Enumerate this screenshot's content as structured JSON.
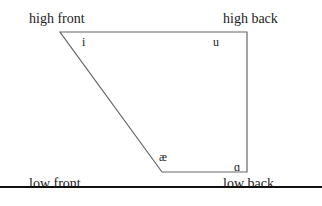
{
  "diagram": {
    "corners": {
      "high_front": "high front",
      "high_back": "high back",
      "low_front": "low front",
      "low_back": "low back"
    },
    "vowels": {
      "i": "i",
      "u": "u",
      "ae": "æ",
      "a": "ɑ"
    },
    "line_color": "#666666"
  }
}
